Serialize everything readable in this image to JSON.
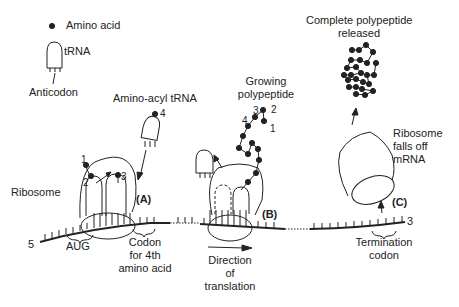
{
  "legend": {
    "amino_acid": "Amino acid",
    "trna": "tRNA",
    "anticodon": "Anticodon"
  },
  "stage_a": {
    "aminoacyl_trna": "Amino-acyl tRNA",
    "ribosome": "Ribosome",
    "label": "(A)",
    "aug": "AUG",
    "codon_4th": [
      "Codon",
      "for 4th",
      "amino acid"
    ],
    "numbers": [
      "1",
      "2",
      "3",
      "4"
    ]
  },
  "stage_b": {
    "growing": [
      "Growing",
      "polypeptide"
    ],
    "label": "(B)",
    "direction": [
      "Direction",
      "of",
      "translation"
    ],
    "numbers": [
      "1",
      "2",
      "3",
      "4"
    ]
  },
  "stage_c": {
    "complete": [
      "Complete polypeptide",
      "released"
    ],
    "falls_off": [
      "Ribosome",
      "falls off",
      "mRNA"
    ],
    "label": "(C)",
    "termination": [
      "Termination",
      "codon"
    ]
  },
  "mrna": {
    "five_prime": "5",
    "three_prime": "3"
  },
  "colors": {
    "line": "#222222",
    "background": "#ffffff"
  }
}
